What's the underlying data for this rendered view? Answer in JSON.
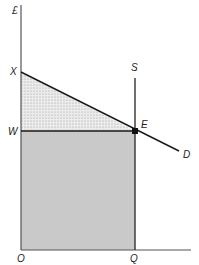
{
  "diagram": {
    "type": "economic-surplus-diagram",
    "y_axis_label": "£",
    "origin_label": "O",
    "price_intercept_label": "X",
    "wage_label": "W",
    "equilibrium_label": "E",
    "supply_label": "S",
    "demand_label": "D",
    "quantity_label": "Q",
    "regions": [
      {
        "name": "surplus-triangle",
        "vertices": [
          "X",
          "W",
          "E"
        ],
        "fill": "dotted-stipple"
      },
      {
        "name": "earnings-rectangle",
        "vertices": [
          "O",
          "W",
          "E",
          "Q"
        ],
        "fill": "#c8c8c8"
      }
    ],
    "colors": {
      "line": "#1a1a1a",
      "axis": "#555555",
      "rectangle_fill": "#c9c9c9",
      "triangle_fill": "#dedede"
    }
  }
}
